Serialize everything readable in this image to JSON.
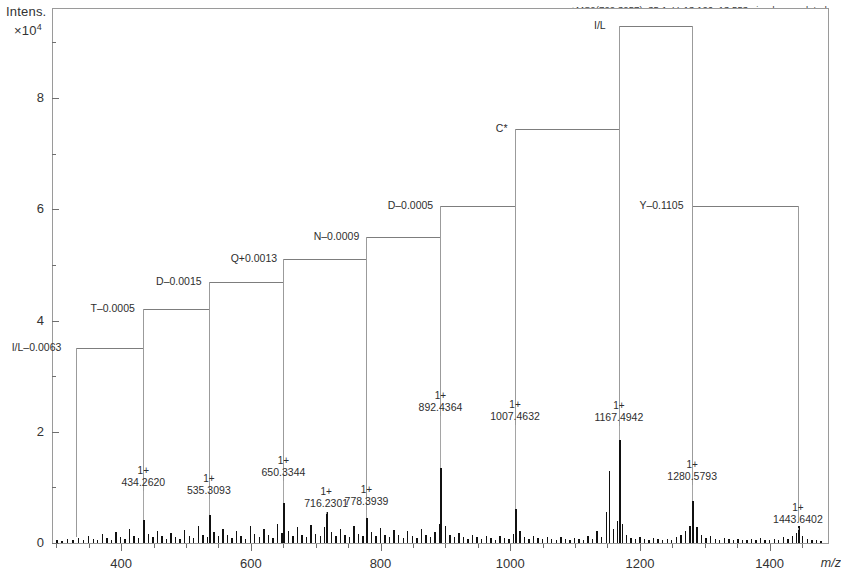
{
  "header": {
    "note": "+MS2(722.3257), 35.1eV, 13.126–13.553min, deconvoluted"
  },
  "axes": {
    "y_title": "Intens.",
    "y_exponent_base": "×10",
    "y_exponent": "4",
    "x_unit": "m/z",
    "y_ticks": [
      "0",
      "2",
      "4",
      "6",
      "8"
    ],
    "x_ticks": [
      "400",
      "600",
      "800",
      "1000",
      "1200",
      "1400"
    ]
  },
  "chart_data": {
    "type": "line",
    "title": "+MS2(722.3257), 35.1eV, 13.126–13.553min, deconvoluted",
    "xlabel": "m/z",
    "ylabel": "Intens. ×10⁴",
    "xlim": [
      295,
      1490
    ],
    "ylim": [
      0,
      9.6
    ],
    "grid": false,
    "legend": null,
    "labeled_peaks": [
      {
        "charge": "1+",
        "mz": "434.2620",
        "x": 434.262,
        "y": 0.42
      },
      {
        "charge": "1+",
        "mz": "535.3093",
        "x": 535.3093,
        "y": 0.5
      },
      {
        "charge": "1+",
        "mz": "650.3344",
        "x": 650.3344,
        "y": 0.72
      },
      {
        "charge": "1+",
        "mz": "716.2301",
        "x": 716.2301,
        "y": 0.55
      },
      {
        "charge": "1+",
        "mz": "778.3939",
        "x": 778.3939,
        "y": 0.45
      },
      {
        "charge": "1+",
        "mz": "892.4364",
        "x": 892.4364,
        "y": 1.35
      },
      {
        "charge": "1+",
        "mz": "1007.4632",
        "x": 1007.4632,
        "y": 0.62
      },
      {
        "charge": "1+",
        "mz": "1167.4942",
        "x": 1167.4942,
        "y": 1.85
      },
      {
        "charge": "1+",
        "mz": "1280.5793",
        "x": 1280.5793,
        "y": 0.75
      },
      {
        "charge": "1+",
        "mz": "1443.6402",
        "x": 1443.6402,
        "y": 0.3
      }
    ],
    "sequence_ladder": [
      {
        "residue": "I/L–0.0063",
        "level": 3.5,
        "from_mz": 330,
        "to_mz": 434.262
      },
      {
        "residue": "T–0.0005",
        "level": 4.2,
        "from_mz": 434.262,
        "to_mz": 535.3093
      },
      {
        "residue": "D–0.0015",
        "level": 4.7,
        "from_mz": 535.3093,
        "to_mz": 650.3344
      },
      {
        "residue": "Q+0.0013",
        "level": 5.1,
        "from_mz": 650.3344,
        "to_mz": 778.3939
      },
      {
        "residue": "N–0.0009",
        "level": 5.5,
        "from_mz": 778.3939,
        "to_mz": 892.4364
      },
      {
        "residue": "D–0.0005",
        "level": 6.05,
        "from_mz": 892.4364,
        "to_mz": 1007.4632
      },
      {
        "residue": "C*",
        "level": 7.45,
        "from_mz": 1007.4632,
        "to_mz": 1167.4942
      },
      {
        "residue": "I/L",
        "level": 9.3,
        "from_mz": 1167.4942,
        "to_mz": 1280.5793
      },
      {
        "residue": "Y–0.1105",
        "level": 6.05,
        "from_mz": 1280.5793,
        "to_mz": 1443.6402
      }
    ],
    "baseline_peaks": [
      [
        300,
        0.05
      ],
      [
        308,
        0.04
      ],
      [
        316,
        0.07
      ],
      [
        325,
        0.05
      ],
      [
        333,
        0.09
      ],
      [
        341,
        0.06
      ],
      [
        349,
        0.12
      ],
      [
        356,
        0.07
      ],
      [
        363,
        0.05
      ],
      [
        370,
        0.16
      ],
      [
        377,
        0.09
      ],
      [
        384,
        0.06
      ],
      [
        391,
        0.2
      ],
      [
        398,
        0.11
      ],
      [
        405,
        0.07
      ],
      [
        412,
        0.26
      ],
      [
        419,
        0.13
      ],
      [
        426,
        0.09
      ],
      [
        434,
        0.42
      ],
      [
        441,
        0.17
      ],
      [
        448,
        0.1
      ],
      [
        455,
        0.22
      ],
      [
        462,
        0.12
      ],
      [
        469,
        0.08
      ],
      [
        476,
        0.18
      ],
      [
        483,
        0.11
      ],
      [
        490,
        0.07
      ],
      [
        497,
        0.24
      ],
      [
        504,
        0.13
      ],
      [
        511,
        0.09
      ],
      [
        518,
        0.31
      ],
      [
        525,
        0.15
      ],
      [
        532,
        0.11
      ],
      [
        535,
        0.5
      ],
      [
        542,
        0.2
      ],
      [
        549,
        0.12
      ],
      [
        556,
        0.26
      ],
      [
        563,
        0.14
      ],
      [
        570,
        0.09
      ],
      [
        577,
        0.22
      ],
      [
        584,
        0.13
      ],
      [
        591,
        0.08
      ],
      [
        598,
        0.3
      ],
      [
        605,
        0.16
      ],
      [
        612,
        0.1
      ],
      [
        619,
        0.25
      ],
      [
        626,
        0.14
      ],
      [
        633,
        0.09
      ],
      [
        640,
        0.35
      ],
      [
        647,
        0.18
      ],
      [
        650,
        0.72
      ],
      [
        657,
        0.22
      ],
      [
        664,
        0.13
      ],
      [
        671,
        0.28
      ],
      [
        678,
        0.15
      ],
      [
        685,
        0.1
      ],
      [
        692,
        0.33
      ],
      [
        699,
        0.17
      ],
      [
        706,
        0.12
      ],
      [
        713,
        0.29
      ],
      [
        716,
        0.55
      ],
      [
        723,
        0.19
      ],
      [
        730,
        0.12
      ],
      [
        737,
        0.26
      ],
      [
        744,
        0.15
      ],
      [
        751,
        0.1
      ],
      [
        758,
        0.31
      ],
      [
        765,
        0.17
      ],
      [
        772,
        0.12
      ],
      [
        778,
        0.45
      ],
      [
        785,
        0.2
      ],
      [
        792,
        0.13
      ],
      [
        799,
        0.27
      ],
      [
        806,
        0.15
      ],
      [
        813,
        0.1
      ],
      [
        820,
        0.24
      ],
      [
        827,
        0.14
      ],
      [
        834,
        0.09
      ],
      [
        841,
        0.21
      ],
      [
        848,
        0.13
      ],
      [
        855,
        0.09
      ],
      [
        862,
        0.26
      ],
      [
        869,
        0.15
      ],
      [
        876,
        0.11
      ],
      [
        883,
        0.2
      ],
      [
        890,
        0.35
      ],
      [
        892,
        1.35
      ],
      [
        899,
        0.3
      ],
      [
        906,
        0.14
      ],
      [
        913,
        0.1
      ],
      [
        920,
        0.18
      ],
      [
        927,
        0.11
      ],
      [
        934,
        0.08
      ],
      [
        941,
        0.15
      ],
      [
        948,
        0.1
      ],
      [
        955,
        0.07
      ],
      [
        962,
        0.13
      ],
      [
        969,
        0.09
      ],
      [
        976,
        0.06
      ],
      [
        983,
        0.12
      ],
      [
        990,
        0.09
      ],
      [
        997,
        0.07
      ],
      [
        1004,
        0.16
      ],
      [
        1007,
        0.62
      ],
      [
        1014,
        0.22
      ],
      [
        1021,
        0.11
      ],
      [
        1028,
        0.08
      ],
      [
        1035,
        0.13
      ],
      [
        1042,
        0.09
      ],
      [
        1049,
        0.07
      ],
      [
        1056,
        0.11
      ],
      [
        1063,
        0.08
      ],
      [
        1070,
        0.06
      ],
      [
        1077,
        0.1
      ],
      [
        1084,
        0.07
      ],
      [
        1091,
        0.05
      ],
      [
        1098,
        0.09
      ],
      [
        1105,
        0.07
      ],
      [
        1112,
        0.05
      ],
      [
        1119,
        0.13
      ],
      [
        1126,
        0.08
      ],
      [
        1133,
        0.21
      ],
      [
        1140,
        0.1
      ],
      [
        1147,
        0.55
      ],
      [
        1152,
        1.3
      ],
      [
        1158,
        0.26
      ],
      [
        1164,
        0.4
      ],
      [
        1167,
        1.85
      ],
      [
        1172,
        0.35
      ],
      [
        1178,
        0.14
      ],
      [
        1185,
        0.09
      ],
      [
        1192,
        0.07
      ],
      [
        1199,
        0.11
      ],
      [
        1206,
        0.08
      ],
      [
        1213,
        0.06
      ],
      [
        1220,
        0.09
      ],
      [
        1227,
        0.07
      ],
      [
        1234,
        0.05
      ],
      [
        1241,
        0.08
      ],
      [
        1248,
        0.06
      ],
      [
        1255,
        0.1
      ],
      [
        1262,
        0.15
      ],
      [
        1269,
        0.22
      ],
      [
        1276,
        0.3
      ],
      [
        1280,
        0.75
      ],
      [
        1287,
        0.28
      ],
      [
        1294,
        0.14
      ],
      [
        1301,
        0.09
      ],
      [
        1308,
        0.12
      ],
      [
        1315,
        0.08
      ],
      [
        1322,
        0.06
      ],
      [
        1329,
        0.09
      ],
      [
        1336,
        0.07
      ],
      [
        1343,
        0.05
      ],
      [
        1350,
        0.08
      ],
      [
        1357,
        0.06
      ],
      [
        1364,
        0.05
      ],
      [
        1371,
        0.07
      ],
      [
        1378,
        0.05
      ],
      [
        1385,
        0.09
      ],
      [
        1392,
        0.06
      ],
      [
        1399,
        0.05
      ],
      [
        1406,
        0.08
      ],
      [
        1413,
        0.06
      ],
      [
        1420,
        0.1
      ],
      [
        1427,
        0.07
      ],
      [
        1434,
        0.12
      ],
      [
        1440,
        0.18
      ],
      [
        1443,
        0.3
      ],
      [
        1450,
        0.13
      ],
      [
        1457,
        0.08
      ],
      [
        1464,
        0.06
      ],
      [
        1471,
        0.05
      ],
      [
        1478,
        0.04
      ]
    ]
  }
}
